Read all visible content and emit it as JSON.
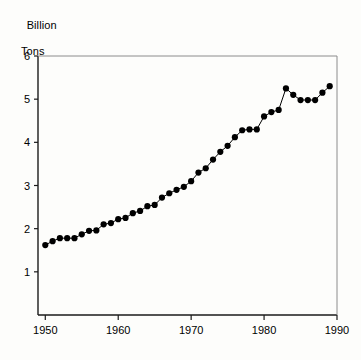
{
  "chart_data": {
    "type": "line",
    "title": "",
    "subtitle": "",
    "xlabel": "",
    "ylabel": "Billion Tons",
    "ylabel_line1": "Billion",
    "ylabel_line2": "Tons",
    "xlim": [
      1949,
      1990
    ],
    "ylim": [
      0,
      6
    ],
    "xticks": [
      1950,
      1960,
      1970,
      1980,
      1990
    ],
    "xtick_labels": [
      "1950",
      "1960",
      "1970",
      "1980",
      "1990"
    ],
    "yticks": [
      1,
      2,
      3,
      4,
      5,
      6
    ],
    "ytick_labels": [
      "1",
      "2",
      "3",
      "4",
      "5",
      "6"
    ],
    "grid": false,
    "legend": false,
    "legend_position": "none",
    "marker": "filled-circle",
    "marker_color": "#000000",
    "line_color": "#000000",
    "x": [
      1950,
      1951,
      1952,
      1953,
      1954,
      1955,
      1956,
      1957,
      1958,
      1959,
      1960,
      1961,
      1962,
      1963,
      1964,
      1965,
      1966,
      1967,
      1968,
      1969,
      1970,
      1971,
      1972,
      1973,
      1974,
      1975,
      1976,
      1977,
      1978,
      1979,
      1980,
      1981,
      1982,
      1983,
      1984,
      1985,
      1986,
      1987,
      1988,
      1989
    ],
    "values": [
      1.62,
      1.71,
      1.78,
      1.78,
      1.78,
      1.87,
      1.95,
      1.96,
      2.1,
      2.13,
      2.22,
      2.25,
      2.36,
      2.41,
      2.52,
      2.55,
      2.72,
      2.82,
      2.9,
      2.97,
      3.1,
      3.3,
      3.4,
      3.6,
      3.78,
      3.92,
      4.12,
      4.28,
      4.3,
      4.3,
      4.6,
      4.7,
      4.75,
      5.25,
      5.1,
      4.98,
      4.98,
      4.98,
      5.15,
      5.3
    ],
    "series_name": "World grain production",
    "units": "Billion Tons"
  }
}
